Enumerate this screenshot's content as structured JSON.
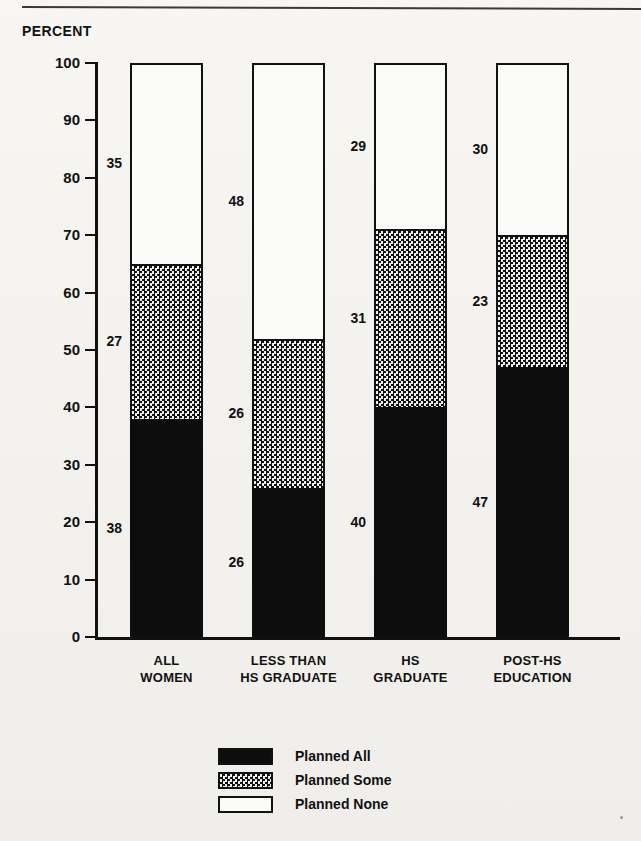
{
  "figure": {
    "axis_title": "PERCENT",
    "top_rule": "horizontal-rule"
  },
  "legend": {
    "items": [
      {
        "label": "Planned All",
        "swatch": "solid-black"
      },
      {
        "label": "Planned Some",
        "swatch": "checkered-gray"
      },
      {
        "label": "Planned None",
        "swatch": "white-outline"
      }
    ]
  },
  "chart_data": {
    "type": "bar",
    "subtype": "stacked-vertical-100",
    "title": "",
    "xlabel": "",
    "ylabel": "PERCENT",
    "ylim": [
      0,
      100
    ],
    "yticks": [
      0,
      10,
      20,
      30,
      40,
      50,
      60,
      70,
      80,
      90,
      100
    ],
    "ytick_labels": [
      "0",
      "10",
      "20",
      "30",
      "40",
      "50",
      "60",
      "70",
      "80",
      "90",
      "100"
    ],
    "grid": false,
    "legend_position": "bottom-center",
    "categories": [
      {
        "lines": [
          "ALL",
          "WOMEN"
        ],
        "text": "ALL WOMEN"
      },
      {
        "lines": [
          "LESS THAN",
          "HS GRADUATE"
        ],
        "text": "LESS THAN HS GRADUATE"
      },
      {
        "lines": [
          "HS",
          "GRADUATE"
        ],
        "text": "HS GRADUATE"
      },
      {
        "lines": [
          "POST-HS",
          "EDUCATION"
        ],
        "text": "POST-HS EDUCATION"
      }
    ],
    "series": [
      {
        "name": "Planned All",
        "values": [
          38,
          26,
          40,
          47
        ]
      },
      {
        "name": "Planned Some",
        "values": [
          27,
          26,
          31,
          23
        ]
      },
      {
        "name": "Planned None",
        "values": [
          35,
          48,
          29,
          30
        ]
      }
    ],
    "bars": [
      {
        "category": "ALL WOMEN",
        "segments": [
          {
            "name": "Planned All",
            "value": 38,
            "label": "38"
          },
          {
            "name": "Planned Some",
            "value": 27,
            "label": "27"
          },
          {
            "name": "Planned None",
            "value": 35,
            "label": "35"
          }
        ]
      },
      {
        "category": "LESS THAN HS GRADUATE",
        "segments": [
          {
            "name": "Planned All",
            "value": 26,
            "label": "26"
          },
          {
            "name": "Planned Some",
            "value": 26,
            "label": "26"
          },
          {
            "name": "Planned None",
            "value": 48,
            "label": "48"
          }
        ]
      },
      {
        "category": "HS GRADUATE",
        "segments": [
          {
            "name": "Planned All",
            "value": 40,
            "label": "40"
          },
          {
            "name": "Planned Some",
            "value": 31,
            "label": "31"
          },
          {
            "name": "Planned None",
            "value": 29,
            "label": "29"
          }
        ]
      },
      {
        "category": "POST-HS EDUCATION",
        "segments": [
          {
            "name": "Planned All",
            "value": 47,
            "label": "47"
          },
          {
            "name": "Planned Some",
            "value": 23,
            "label": "23"
          },
          {
            "name": "Planned None",
            "value": 30,
            "label": "30"
          }
        ]
      }
    ]
  }
}
